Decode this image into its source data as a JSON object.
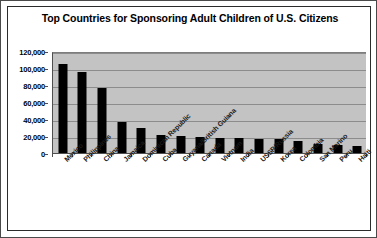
{
  "chart_data": {
    "type": "bar",
    "title": "Top Countries for Sponsoring Adult Children of U.S. Citizens",
    "xlabel": "",
    "ylabel": "",
    "ylim": [
      0,
      120000
    ],
    "ytick_labels": [
      "120,000",
      "100,000",
      "80,000",
      "60,000",
      "40,000",
      "20,000",
      "0"
    ],
    "ytick_values": [
      120000,
      100000,
      80000,
      60000,
      40000,
      20000,
      0
    ],
    "grid": true,
    "legend": "none",
    "series_color": "#000000",
    "plot_background": "#c3c3c3",
    "categories": [
      "Mexico",
      "Philippines",
      "China",
      "Jamaica",
      "Dominican Republic",
      "Cuba",
      "Guyana/British Guiana",
      "Canada",
      "Vietnam",
      "India",
      "USSR/Russia",
      "Korea",
      "Colombia",
      "San Marino",
      "Peru",
      "Haiti"
    ],
    "values": [
      105000,
      95000,
      76000,
      36000,
      29000,
      21000,
      20000,
      19000,
      18000,
      18000,
      17000,
      17000,
      14000,
      11000,
      9000,
      8000
    ]
  }
}
